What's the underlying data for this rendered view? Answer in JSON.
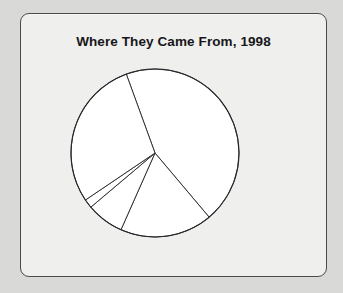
{
  "page": {
    "background_color": "#d9d9d7",
    "panel_background_color": "#efefed",
    "panel_border_color": "#4a4a4a"
  },
  "figure": {
    "title": "Where They Came From, 1998"
  },
  "chart_data": {
    "type": "pie",
    "title": "Where They Came From, 1998",
    "xlabel": "",
    "ylabel": "",
    "legend": "none",
    "grid": false,
    "labels_shown": false,
    "stroke_color": "#26262a",
    "slice_fill_color": "#ffffff",
    "start_angle_deg": 110,
    "direction": "clockwise",
    "geometry": {
      "center_x": 90,
      "center_y": 90,
      "radius": 84,
      "boundary_angles_deg": [
        110,
        315,
        309,
        283,
        219
      ]
    },
    "categories": [
      "Slice 1",
      "Slice 2",
      "Slice 3",
      "Slice 4",
      "Slice 5"
    ],
    "values": [
      44.4,
      17.8,
      7.2,
      1.7,
      28.9
    ],
    "slice_angles_deg": [
      160,
      64,
      26,
      6,
      104
    ]
  }
}
